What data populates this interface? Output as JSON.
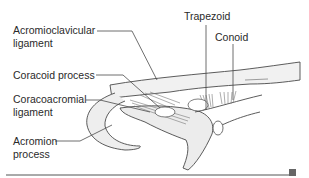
{
  "figure": {
    "labels": {
      "acromioclavicular_line1": "Acromioclavicular",
      "acromioclavicular_line2": "ligament",
      "coracoid": "Coracoid process",
      "coracoacromial_line1": "Coracoacromial",
      "coracoacromial_line2": "ligament",
      "acromion_line1": "Acromion",
      "acromion_line2": "process",
      "trapezoid": "Trapezoid",
      "conoid": "Conoid"
    },
    "colors": {
      "text": "#2a2a2a",
      "line": "#4a4a4a",
      "fill": "#ececec",
      "rule": "#555555",
      "marker": "#666666"
    }
  }
}
